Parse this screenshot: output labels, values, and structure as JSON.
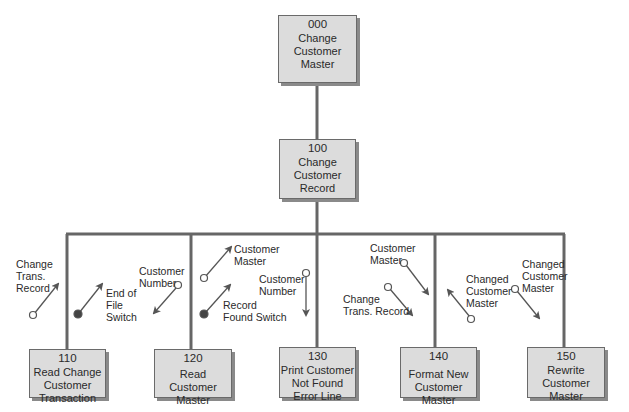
{
  "modules": [
    {
      "id": "000",
      "title": "Change\nCustomer\nMaster"
    },
    {
      "id": "100",
      "title": "Change\nCustomer\nRecord"
    },
    {
      "id": "110",
      "title": "Read Change\nCustomer\nTransaction"
    },
    {
      "id": "120",
      "title": "Read Customer\nMaster"
    },
    {
      "id": "130",
      "title": "Print Customer\nNot Found\nError Line"
    },
    {
      "id": "140",
      "title": "Format New\nCustomer Master"
    },
    {
      "id": "150",
      "title": "Rewrite\nCustomer\nMaster"
    }
  ],
  "couples": [
    {
      "label": "Change\nTrans.\nRecord",
      "type": "data",
      "direction": "up",
      "module": "110"
    },
    {
      "label": "End of\nFile\nSwitch",
      "type": "control",
      "direction": "up",
      "module": "110"
    },
    {
      "label": "Customer\nNumber",
      "type": "data",
      "direction": "down",
      "module": "120"
    },
    {
      "label": "Customer\nMaster",
      "type": "data",
      "direction": "up",
      "module": "120"
    },
    {
      "label": "Record\nFound Switch",
      "type": "control",
      "direction": "up",
      "module": "120"
    },
    {
      "label": "Customer\nNumber",
      "type": "data",
      "direction": "down",
      "module": "130"
    },
    {
      "label": "Customer\nMaster",
      "type": "data",
      "direction": "down",
      "module": "140"
    },
    {
      "label": "Change\nTrans. Record",
      "type": "data",
      "direction": "down",
      "module": "140"
    },
    {
      "label": "Changed\nCustomer\nMaster",
      "type": "data",
      "direction": "up",
      "module": "140"
    },
    {
      "label": "Changed\nCustomer\nMaster",
      "type": "data",
      "direction": "down",
      "module": "150"
    }
  ]
}
